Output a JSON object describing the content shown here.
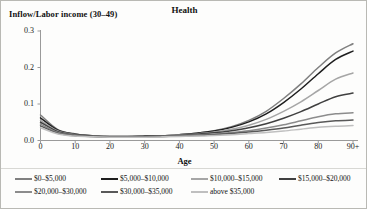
{
  "figure": {
    "title": "Health",
    "ylabel": "Inflow/Labor income (30–49)",
    "xlabel": "Age"
  },
  "axes": {
    "ytick_labels": [
      "0.3",
      "0.2",
      "0.1",
      "0.0"
    ],
    "xtick_labels": [
      "0",
      "10",
      "20",
      "30",
      "40",
      "50",
      "60",
      "70",
      "80",
      "90+"
    ]
  },
  "legend": {
    "row1": [
      {
        "label": "$0–$5,000",
        "color": "#808080"
      },
      {
        "label": "$5,000–$10,000",
        "color": "#1f1f1f"
      },
      {
        "label": "$10,000–$15,000",
        "color": "#a6a6a6"
      },
      {
        "label": "$15,000–$20,000",
        "color": "#404040"
      }
    ],
    "row2": [
      {
        "label": "$20,000–$30,000",
        "color": "#8c8c8c"
      },
      {
        "label": "$30,000–$35,000",
        "color": "#595959"
      },
      {
        "label": "above $35,000",
        "color": "#bfbfbf"
      }
    ]
  },
  "chart_data": {
    "type": "line",
    "title": "Health",
    "xlabel": "Age",
    "ylabel": "Inflow/Labor income (30–49)",
    "xlim": [
      0,
      90
    ],
    "ylim": [
      0.0,
      0.3
    ],
    "ytick_values": [
      0.0,
      0.1,
      0.2,
      0.3
    ],
    "xtick_values": [
      0,
      10,
      20,
      30,
      40,
      50,
      60,
      70,
      80,
      90
    ],
    "grid": false,
    "legend_position": "bottom",
    "x": [
      0,
      5,
      10,
      15,
      20,
      25,
      30,
      35,
      40,
      45,
      50,
      55,
      60,
      65,
      70,
      75,
      80,
      85,
      90
    ],
    "series": [
      {
        "name": "$0–$5,000",
        "color": "#808080",
        "values": [
          0.07,
          0.03,
          0.018,
          0.013,
          0.011,
          0.011,
          0.012,
          0.013,
          0.016,
          0.02,
          0.027,
          0.038,
          0.055,
          0.08,
          0.115,
          0.155,
          0.2,
          0.24,
          0.265
        ]
      },
      {
        "name": "$5,000–$10,000",
        "color": "#1f1f1f",
        "values": [
          0.062,
          0.028,
          0.017,
          0.013,
          0.011,
          0.011,
          0.012,
          0.013,
          0.016,
          0.02,
          0.026,
          0.036,
          0.051,
          0.073,
          0.104,
          0.141,
          0.183,
          0.222,
          0.245
        ]
      },
      {
        "name": "$10,000–$15,000",
        "color": "#a6a6a6",
        "values": [
          0.055,
          0.026,
          0.016,
          0.012,
          0.011,
          0.011,
          0.011,
          0.013,
          0.015,
          0.018,
          0.023,
          0.031,
          0.042,
          0.058,
          0.08,
          0.106,
          0.137,
          0.168,
          0.185
        ]
      },
      {
        "name": "$15,000–$20,000",
        "color": "#404040",
        "values": [
          0.05,
          0.024,
          0.015,
          0.012,
          0.01,
          0.01,
          0.011,
          0.012,
          0.014,
          0.017,
          0.021,
          0.027,
          0.035,
          0.046,
          0.061,
          0.079,
          0.1,
          0.12,
          0.13
        ]
      },
      {
        "name": "$20,000–$30,000",
        "color": "#8c8c8c",
        "values": [
          0.045,
          0.022,
          0.014,
          0.011,
          0.01,
          0.01,
          0.01,
          0.011,
          0.013,
          0.015,
          0.018,
          0.022,
          0.027,
          0.034,
          0.043,
          0.054,
          0.065,
          0.073,
          0.076
        ]
      },
      {
        "name": "$30,000–$35,000",
        "color": "#595959",
        "values": [
          0.04,
          0.02,
          0.013,
          0.011,
          0.01,
          0.01,
          0.01,
          0.011,
          0.012,
          0.014,
          0.016,
          0.019,
          0.023,
          0.028,
          0.034,
          0.042,
          0.049,
          0.054,
          0.056
        ]
      },
      {
        "name": "above $35,000",
        "color": "#bfbfbf",
        "values": [
          0.035,
          0.018,
          0.012,
          0.01,
          0.009,
          0.009,
          0.009,
          0.01,
          0.011,
          0.012,
          0.014,
          0.016,
          0.019,
          0.022,
          0.026,
          0.031,
          0.036,
          0.039,
          0.041
        ]
      }
    ]
  }
}
